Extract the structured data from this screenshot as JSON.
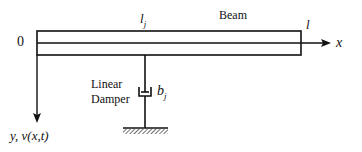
{
  "diagram": {
    "labels": {
      "origin": "0",
      "position_var": "l",
      "position_sub": "j",
      "beam": "Beam",
      "length": "l",
      "x_axis": "x",
      "damper_line1": "Linear",
      "damper_line2": "Damper",
      "damper_coef": "b",
      "damper_coef_sub": "j",
      "y_axis": "y, v(x,t)"
    },
    "colors": {
      "stroke": "#111111",
      "background": "#ffffff"
    }
  }
}
